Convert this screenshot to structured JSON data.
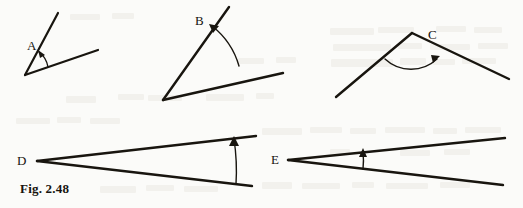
{
  "figure": {
    "caption": "Fig. 2.48",
    "ink_color": "#18150f",
    "background_color": "#fbfbf9",
    "width": 523,
    "height": 208,
    "angles": [
      {
        "id": "A",
        "label": "A",
        "label_x": 27,
        "label_y": 50,
        "vertex": {
          "x": 25,
          "y": 75
        },
        "ray1_end": {
          "x": 58,
          "y": 13
        },
        "ray2_end": {
          "x": 98,
          "y": 50
        },
        "arc_radius": 24,
        "arrow_on": "ray1",
        "opening": "acute"
      },
      {
        "id": "B",
        "label": "B",
        "label_x": 195,
        "label_y": 25,
        "vertex": {
          "x": 163,
          "y": 100
        },
        "ray1_end": {
          "x": 229,
          "y": 7
        },
        "ray2_end": {
          "x": 283,
          "y": 73
        },
        "arc_radius": 78,
        "arrow_on": "ray1",
        "opening": "acute"
      },
      {
        "id": "C",
        "label": "C",
        "label_x": 428,
        "label_y": 39,
        "vertex": {
          "x": 412,
          "y": 33
        },
        "ray1_end": {
          "x": 336,
          "y": 97
        },
        "ray2_end": {
          "x": 509,
          "y": 79
        },
        "arc_radius": 36,
        "arrow_on": "ray2",
        "opening": "obtuse"
      },
      {
        "id": "D",
        "label": "D",
        "label_x": 17,
        "label_y": 165,
        "vertex": {
          "x": 37,
          "y": 161
        },
        "ray1_end": {
          "x": 256,
          "y": 136
        },
        "ray2_end": {
          "x": 252,
          "y": 186
        },
        "arc_radius": 212,
        "arrow_on": "ray1",
        "opening": "narrow"
      },
      {
        "id": "E",
        "label": "E",
        "label_x": 271,
        "label_y": 164,
        "vertex": {
          "x": 288,
          "y": 160
        },
        "ray1_end": {
          "x": 505,
          "y": 138
        },
        "ray2_end": {
          "x": 503,
          "y": 185
        },
        "arc_radius": 76,
        "arrow_on": "ray1",
        "opening": "narrow"
      }
    ]
  },
  "speckles": [
    {
      "x": 66,
      "y": 96,
      "w": 30,
      "h": 7
    },
    {
      "x": 118,
      "y": 94,
      "w": 26,
      "h": 6
    },
    {
      "x": 148,
      "y": 95,
      "w": 34,
      "h": 6
    },
    {
      "x": 206,
      "y": 94,
      "w": 38,
      "h": 7
    },
    {
      "x": 256,
      "y": 93,
      "w": 18,
      "h": 6
    },
    {
      "x": 330,
      "y": 28,
      "w": 44,
      "h": 7
    },
    {
      "x": 378,
      "y": 27,
      "w": 36,
      "h": 6
    },
    {
      "x": 436,
      "y": 26,
      "w": 30,
      "h": 6
    },
    {
      "x": 474,
      "y": 27,
      "w": 28,
      "h": 6
    },
    {
      "x": 333,
      "y": 44,
      "w": 58,
      "h": 7
    },
    {
      "x": 398,
      "y": 43,
      "w": 24,
      "h": 6
    },
    {
      "x": 430,
      "y": 44,
      "w": 40,
      "h": 6
    },
    {
      "x": 478,
      "y": 43,
      "w": 30,
      "h": 6
    },
    {
      "x": 331,
      "y": 59,
      "w": 62,
      "h": 8
    },
    {
      "x": 400,
      "y": 58,
      "w": 26,
      "h": 7
    },
    {
      "x": 433,
      "y": 59,
      "w": 22,
      "h": 6
    },
    {
      "x": 462,
      "y": 58,
      "w": 34,
      "h": 6
    },
    {
      "x": 16,
      "y": 118,
      "w": 34,
      "h": 6
    },
    {
      "x": 57,
      "y": 117,
      "w": 24,
      "h": 6
    },
    {
      "x": 90,
      "y": 118,
      "w": 30,
      "h": 6
    },
    {
      "x": 262,
      "y": 128,
      "w": 40,
      "h": 7
    },
    {
      "x": 310,
      "y": 127,
      "w": 32,
      "h": 6
    },
    {
      "x": 350,
      "y": 128,
      "w": 26,
      "h": 6
    },
    {
      "x": 385,
      "y": 127,
      "w": 40,
      "h": 6
    },
    {
      "x": 433,
      "y": 128,
      "w": 24,
      "h": 6
    },
    {
      "x": 465,
      "y": 127,
      "w": 36,
      "h": 6
    },
    {
      "x": 330,
      "y": 149,
      "w": 20,
      "h": 6
    },
    {
      "x": 400,
      "y": 150,
      "w": 30,
      "h": 6
    },
    {
      "x": 444,
      "y": 149,
      "w": 26,
      "h": 6
    },
    {
      "x": 100,
      "y": 186,
      "w": 36,
      "h": 7
    },
    {
      "x": 146,
      "y": 185,
      "w": 28,
      "h": 6
    },
    {
      "x": 184,
      "y": 186,
      "w": 34,
      "h": 6
    },
    {
      "x": 262,
      "y": 182,
      "w": 30,
      "h": 7
    },
    {
      "x": 302,
      "y": 183,
      "w": 38,
      "h": 6
    },
    {
      "x": 352,
      "y": 182,
      "w": 22,
      "h": 6
    },
    {
      "x": 386,
      "y": 183,
      "w": 42,
      "h": 6
    },
    {
      "x": 440,
      "y": 182,
      "w": 30,
      "h": 6
    },
    {
      "x": 70,
      "y": 14,
      "w": 30,
      "h": 6
    },
    {
      "x": 112,
      "y": 13,
      "w": 22,
      "h": 6
    },
    {
      "x": 238,
      "y": 58,
      "w": 26,
      "h": 6
    },
    {
      "x": 276,
      "y": 57,
      "w": 20,
      "h": 6
    }
  ]
}
